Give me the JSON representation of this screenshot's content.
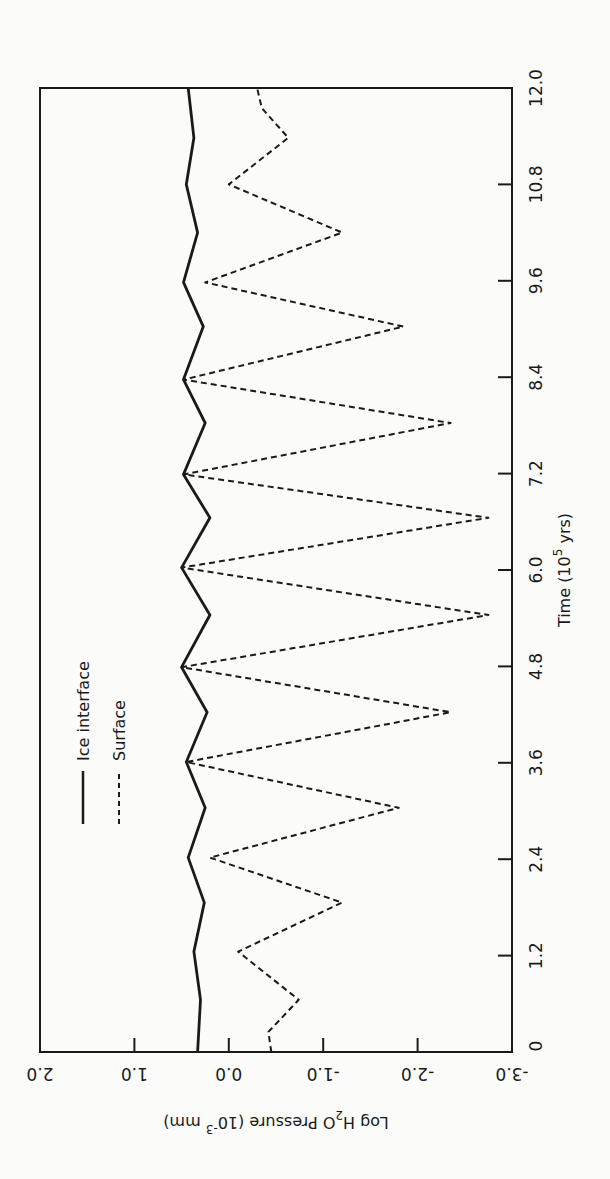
{
  "chart_data": {
    "type": "line",
    "title": "",
    "xlabel": "Time (10^5 yrs)",
    "xlabel_main": "Time (10",
    "xlabel_sup": "5",
    "xlabel_tail": " yrs)",
    "ylabel": "Log H2O Pressure (10^-3 mm)",
    "ylabel_main": "Log H",
    "ylabel_sub": "2",
    "ylabel_mid": "O  Pressure  (10",
    "ylabel_sup": "-3",
    "ylabel_tail": " mm)",
    "xlim": [
      0,
      12.0
    ],
    "ylim": [
      -3.0,
      2.0
    ],
    "xticks": [
      "0",
      "1.2",
      "2.4",
      "3.6",
      "4.8",
      "6.0",
      "7.2",
      "8.4",
      "9.6",
      "10.8",
      "12.0"
    ],
    "xtick_values": [
      0,
      1.2,
      2.4,
      3.6,
      4.8,
      6.0,
      7.2,
      8.4,
      9.6,
      10.8,
      12.0
    ],
    "yticks": [
      "-3.0",
      "-2.0",
      "-1.0",
      "0.0",
      "1.0",
      "2.0"
    ],
    "ytick_values": [
      -3.0,
      -2.0,
      -1.0,
      0.0,
      1.0,
      2.0
    ],
    "grid": false,
    "legend_position": "upper-left",
    "series": [
      {
        "name": "Ice interface",
        "style": "solid",
        "color": "#1a1a1a",
        "points": [
          [
            0.0,
            0.33
          ],
          [
            0.65,
            0.3
          ],
          [
            1.25,
            0.37
          ],
          [
            1.86,
            0.26
          ],
          [
            2.42,
            0.43
          ],
          [
            3.04,
            0.25
          ],
          [
            3.61,
            0.45
          ],
          [
            4.23,
            0.23
          ],
          [
            4.79,
            0.5
          ],
          [
            5.44,
            0.2
          ],
          [
            6.03,
            0.5
          ],
          [
            6.65,
            0.2
          ],
          [
            7.19,
            0.48
          ],
          [
            7.83,
            0.25
          ],
          [
            8.37,
            0.48
          ],
          [
            9.03,
            0.27
          ],
          [
            9.58,
            0.48
          ],
          [
            10.2,
            0.33
          ],
          [
            10.8,
            0.45
          ],
          [
            11.38,
            0.37
          ],
          [
            12.0,
            0.43
          ]
        ]
      },
      {
        "name": "Surface",
        "style": "dashed",
        "color": "#1a1a1a",
        "points": [
          [
            0.0,
            -0.45
          ],
          [
            0.25,
            -0.42
          ],
          [
            0.65,
            -0.74
          ],
          [
            1.25,
            -0.1
          ],
          [
            1.86,
            -1.2
          ],
          [
            2.42,
            0.2
          ],
          [
            3.04,
            -1.8
          ],
          [
            3.61,
            0.45
          ],
          [
            4.23,
            -2.35
          ],
          [
            4.79,
            0.5
          ],
          [
            5.44,
            -2.75
          ],
          [
            6.03,
            0.5
          ],
          [
            6.65,
            -2.75
          ],
          [
            7.19,
            0.48
          ],
          [
            7.83,
            -2.35
          ],
          [
            8.37,
            0.48
          ],
          [
            9.03,
            -1.85
          ],
          [
            9.58,
            0.25
          ],
          [
            10.2,
            -1.2
          ],
          [
            10.8,
            0.0
          ],
          [
            11.38,
            -0.63
          ],
          [
            11.75,
            -0.35
          ],
          [
            12.0,
            -0.3
          ]
        ]
      }
    ]
  }
}
